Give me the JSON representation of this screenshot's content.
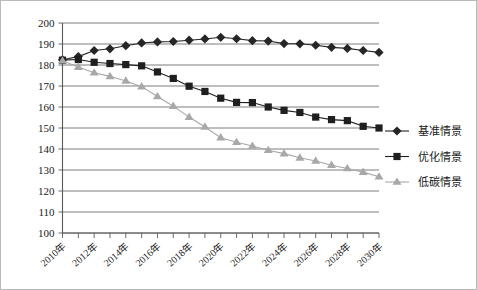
{
  "chart_data": {
    "type": "line",
    "title": "",
    "subtitle": "",
    "xlabel": "",
    "ylabel": "",
    "ylim": [
      100,
      200
    ],
    "ytick_step": 10,
    "yticks": [
      100,
      110,
      120,
      130,
      140,
      150,
      160,
      170,
      180,
      190,
      200
    ],
    "grid": true,
    "legend_position": "right",
    "x": [
      2010,
      2011,
      2012,
      2013,
      2014,
      2015,
      2016,
      2017,
      2018,
      2019,
      2020,
      2021,
      2022,
      2023,
      2024,
      2025,
      2026,
      2027,
      2028,
      2029,
      2030
    ],
    "categories": [
      "2010年",
      "2011年",
      "2012年",
      "2013年",
      "2014年",
      "2015年",
      "2016年",
      "2017年",
      "2018年",
      "2019年",
      "2020年",
      "2021年",
      "2022年",
      "2023年",
      "2024年",
      "2025年",
      "2026年",
      "2027年",
      "2028年",
      "2029年",
      "2030年"
    ],
    "xtick_labels_shown": [
      "2010年",
      "2012年",
      "2014年",
      "2016年",
      "2018年",
      "2020年",
      "2022年",
      "2024年",
      "2026年",
      "2028年",
      "2030年"
    ],
    "series": [
      {
        "name": "基准情景",
        "marker": "diamond",
        "color": "#262626",
        "values": [
          182.5,
          184.0,
          186.9,
          187.7,
          189.2,
          190.5,
          191.0,
          191.2,
          191.8,
          192.4,
          193.2,
          192.5,
          191.6,
          191.4,
          190.2,
          190.1,
          189.4,
          188.4,
          187.9,
          186.9,
          186.0
        ]
      },
      {
        "name": "优化情景",
        "marker": "square",
        "color": "#1f1f1f",
        "values": [
          182.3,
          182.6,
          181.3,
          180.7,
          180.2,
          179.6,
          176.7,
          173.6,
          169.9,
          167.4,
          164.2,
          162.2,
          162.1,
          160.0,
          158.4,
          157.4,
          155.2,
          154.0,
          153.5,
          150.8,
          150.0
        ]
      },
      {
        "name": "低碳情景",
        "marker": "triangle",
        "color": "#a8a8a8",
        "values": [
          182.0,
          179.0,
          176.3,
          174.6,
          172.4,
          169.7,
          165.0,
          160.4,
          155.2,
          150.5,
          145.4,
          143.2,
          141.4,
          139.4,
          137.8,
          135.8,
          134.3,
          132.3,
          130.7,
          129.0,
          126.8
        ]
      }
    ]
  },
  "legend": {
    "items": [
      {
        "label": "基准情景",
        "marker": "diamond",
        "color": "#262626"
      },
      {
        "label": "优化情景",
        "marker": "square",
        "color": "#1f1f1f"
      },
      {
        "label": "低碳情景",
        "marker": "triangle",
        "color": "#a8a8a8"
      }
    ]
  },
  "axis": {
    "y_labels": [
      "200",
      "190",
      "180",
      "170",
      "160",
      "150",
      "140",
      "130",
      "120",
      "110",
      "100"
    ],
    "x_labels": [
      "2010年",
      "2012年",
      "2014年",
      "2016年",
      "2018年",
      "2020年",
      "2022年",
      "2024年",
      "2026年",
      "2028年",
      "2030年"
    ]
  }
}
